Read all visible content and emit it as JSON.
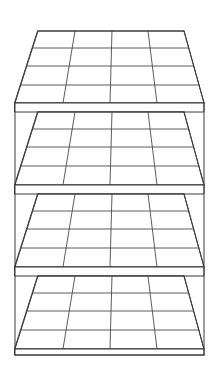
{
  "figure": {
    "view": "front perspective, viewed from slightly above",
    "canvas": {
      "width": 218,
      "height": 365
    },
    "colors": {
      "background": "#ffffff",
      "line": "#3a3a3a",
      "line_light": "#4a4a4a",
      "fill": "#ffffff"
    },
    "style": {
      "stroke_width": 1,
      "fill": "none",
      "shading": "none"
    }
  },
  "structure": {
    "type": "shelving-unit",
    "tier_count": 4,
    "grid_columns": 4,
    "grid_rows": 4,
    "cells_per_tier": 16,
    "total_cells": 64,
    "has_left_post": true,
    "has_right_post": true,
    "has_front_rail": true
  },
  "geometry": {
    "left_post_x": 15,
    "right_post_x": 204,
    "post_top_y": 103,
    "post_bottom_y": 355,
    "front_left_x": 15,
    "front_right_x": 204,
    "back_left_x": 38,
    "back_right_x": 184,
    "back_column_x": [
      38,
      75,
      112,
      148,
      184
    ],
    "front_column_x": [
      15,
      63,
      110,
      157,
      204
    ],
    "rail_height": 9
  },
  "tiers": [
    {
      "index": 1,
      "label": "tier-1-top",
      "back_y": 31,
      "front_y": 103,
      "row_y": [
        31,
        48,
        66,
        85,
        103
      ],
      "rail_top_y": 103,
      "rail_bottom_y": 112
    },
    {
      "index": 2,
      "label": "tier-2",
      "back_y": 112,
      "front_y": 185,
      "row_y": [
        112,
        129,
        147,
        166,
        185
      ],
      "rail_top_y": 185,
      "rail_bottom_y": 194
    },
    {
      "index": 3,
      "label": "tier-3",
      "back_y": 194,
      "front_y": 267,
      "row_y": [
        194,
        211,
        229,
        248,
        267
      ],
      "rail_top_y": 267,
      "rail_bottom_y": 276
    },
    {
      "index": 4,
      "label": "tier-4-bottom",
      "back_y": 276,
      "front_y": 349,
      "row_y": [
        276,
        293,
        311,
        330,
        349
      ],
      "rail_top_y": 349,
      "rail_bottom_y": 355
    }
  ]
}
